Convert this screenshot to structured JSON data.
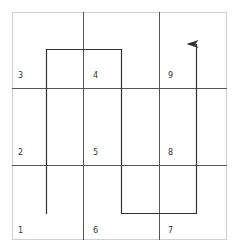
{
  "diagram": {
    "type": "grid-path",
    "grid": {
      "rows": 3,
      "cols": 3
    },
    "colors": {
      "border": "#cfcfcf",
      "grid_line": "#555555",
      "path": "#333333",
      "label": "#333333"
    },
    "cells": [
      {
        "label": "3",
        "row": 0,
        "col": 0
      },
      {
        "label": "4",
        "row": 0,
        "col": 1
      },
      {
        "label": "9",
        "row": 0,
        "col": 2
      },
      {
        "label": "2",
        "row": 1,
        "col": 0
      },
      {
        "label": "5",
        "row": 1,
        "col": 1
      },
      {
        "label": "8",
        "row": 1,
        "col": 2
      },
      {
        "label": "1",
        "row": 2,
        "col": 0
      },
      {
        "label": "6",
        "row": 2,
        "col": 1
      },
      {
        "label": "7",
        "row": 2,
        "col": 2
      }
    ],
    "path_description": "Serpentine path starting in cell 1, up through 2 and 3, across to 4, down through 5 and 6, across to 7, up through 8 and 9 ending with an arrowhead",
    "path_order": [
      "1",
      "2",
      "3",
      "4",
      "5",
      "6",
      "7",
      "8",
      "9"
    ]
  }
}
